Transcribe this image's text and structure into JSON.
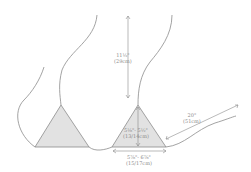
{
  "diagram": {
    "colors": {
      "line": "#8c8c8c",
      "fill": "#e2e2e2",
      "text": "#8a8a8a"
    },
    "labels": {
      "strap_length_in": "11½\"",
      "strap_length_cm": "(29cm)",
      "cup_height_in": "5⅛\"- 5½\"",
      "cup_height_cm": "(13/14cm)",
      "cup_width_in": "5⅞\"- 6⅞\"",
      "cup_width_cm": "(15/17cm)",
      "tie_length_in": "20\"",
      "tie_length_cm": "(51cm)"
    }
  }
}
